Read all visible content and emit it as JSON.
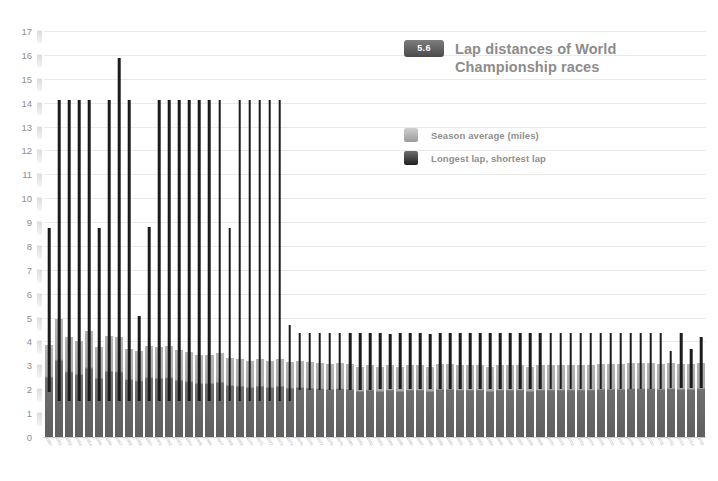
{
  "chart_data": {
    "type": "bar",
    "title": "Lap distances of World Championship races",
    "badge": "5.6",
    "xlabel": "",
    "ylabel": "",
    "ylim": [
      0,
      17
    ],
    "ytick_step": 1,
    "yticks": [
      "0",
      "1",
      "2",
      "3",
      "4",
      "5",
      "6",
      "7",
      "8",
      "9",
      "10",
      "11",
      "12",
      "13",
      "14",
      "15",
      "16",
      "17"
    ],
    "grid": true,
    "legend_position": "top-right",
    "legend": [
      {
        "key": "season_average",
        "label": "Season average (miles)",
        "color": "#adadad"
      },
      {
        "key": "lap_range",
        "label": "Longest lap, shortest lap",
        "color": "#1c1c1c"
      }
    ],
    "series": [
      {
        "name": "Season average (miles)",
        "key": "season_average"
      },
      {
        "name": "Longest lap, shortest lap",
        "key": "lap_range"
      }
    ],
    "categories": [
      "1950",
      "1951",
      "1952",
      "1953",
      "1954",
      "1955",
      "1956",
      "1957",
      "1958",
      "1959",
      "1960",
      "1961",
      "1962",
      "1963",
      "1964",
      "1965",
      "1966",
      "1967",
      "1968",
      "1969",
      "1970",
      "1971",
      "1972",
      "1973",
      "1974",
      "1975",
      "1976",
      "1977",
      "1978",
      "1979",
      "1980",
      "1981",
      "1982",
      "1983",
      "1984",
      "1985",
      "1986",
      "1987",
      "1988",
      "1989",
      "1990",
      "1991",
      "1992",
      "1993",
      "1994",
      "1995",
      "1996",
      "1997",
      "1998",
      "1999",
      "2000",
      "2001",
      "2002",
      "2003",
      "2004",
      "2005",
      "2006",
      "2007",
      "2008",
      "2009",
      "2010",
      "2011",
      "2012",
      "2013",
      "2014",
      "2015"
    ],
    "season_average": [
      3.85,
      4.95,
      4.2,
      4.0,
      4.45,
      3.75,
      4.25,
      4.2,
      3.7,
      3.6,
      3.8,
      3.75,
      3.8,
      3.65,
      3.55,
      3.45,
      3.45,
      3.5,
      3.3,
      3.25,
      3.2,
      3.25,
      3.2,
      3.25,
      3.15,
      3.2,
      3.15,
      3.1,
      3.05,
      3.1,
      3.05,
      2.95,
      3.0,
      2.95,
      3.0,
      2.95,
      3.0,
      3.0,
      2.95,
      3.05,
      3.05,
      3.0,
      3.0,
      3.0,
      2.95,
      3.0,
      3.0,
      3.0,
      2.95,
      3.0,
      3.0,
      3.0,
      3.0,
      3.0,
      3.0,
      3.05,
      3.05,
      3.05,
      3.1,
      3.1,
      3.1,
      3.05,
      3.1,
      3.05,
      3.05,
      3.1
    ],
    "longest_lap": [
      8.75,
      14.1,
      14.1,
      14.1,
      14.1,
      8.75,
      14.1,
      15.85,
      14.1,
      5.05,
      8.8,
      14.1,
      14.1,
      14.1,
      14.1,
      14.1,
      14.1,
      14.1,
      8.75,
      14.1,
      14.1,
      14.1,
      14.1,
      14.1,
      4.7,
      4.35,
      4.35,
      4.35,
      4.35,
      4.35,
      4.35,
      4.35,
      4.35,
      4.35,
      4.3,
      4.35,
      4.35,
      4.35,
      4.3,
      4.35,
      4.35,
      4.35,
      4.35,
      4.35,
      4.35,
      4.35,
      4.35,
      4.35,
      4.35,
      4.35,
      4.35,
      4.35,
      4.35,
      4.35,
      4.35,
      4.35,
      4.35,
      4.35,
      4.35,
      4.35,
      4.35,
      4.35,
      3.6,
      4.35,
      3.7,
      4.2
    ],
    "shortest_lap": [
      1.9,
      1.5,
      1.5,
      1.5,
      1.5,
      1.5,
      1.5,
      1.5,
      1.5,
      1.5,
      1.5,
      1.5,
      1.5,
      1.5,
      1.5,
      1.5,
      1.5,
      1.5,
      1.5,
      1.5,
      1.5,
      1.5,
      1.5,
      1.5,
      1.5,
      1.95,
      1.95,
      1.95,
      1.95,
      1.95,
      1.95,
      1.95,
      1.95,
      2.0,
      2.0,
      2.0,
      2.0,
      2.0,
      2.0,
      2.0,
      2.0,
      2.0,
      2.0,
      2.0,
      2.0,
      2.0,
      2.0,
      2.0,
      2.0,
      2.0,
      2.0,
      2.0,
      2.0,
      2.0,
      2.0,
      2.0,
      2.0,
      2.0,
      2.0,
      2.0,
      2.0,
      2.0,
      2.05,
      2.05,
      2.05,
      2.05
    ]
  }
}
